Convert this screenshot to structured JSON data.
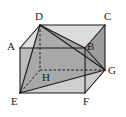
{
  "figure": {
    "kind": "geometry-diagram",
    "shape_name": "rectangular prism",
    "width": 126,
    "height": 117,
    "background_color": "#ffffff",
    "edge_color": "#1a1a1a",
    "hidden_edge_color": "#1a1a1a",
    "label_color": "#1a1a1a",
    "fill_front_color": "#b5b5b5",
    "fill_top_color": "#d2d2d2",
    "fill_right_color": "#9e9e9e",
    "fill_tetra_color": "#a8a8a8",
    "fill_bottom_color": "#c8c8c8"
  },
  "vertices": [
    {
      "id": "A",
      "label": "A",
      "x": 20,
      "y": 48,
      "label_x": 7,
      "label_y": 41,
      "hidden": false
    },
    {
      "id": "B",
      "label": "B",
      "x": 85,
      "y": 48,
      "label_x": 87,
      "label_y": 41,
      "hidden": false
    },
    {
      "id": "C",
      "label": "C",
      "x": 105,
      "y": 25,
      "label_x": 105,
      "label_y": 11,
      "hidden": false
    },
    {
      "id": "D",
      "label": "D",
      "x": 40,
      "y": 25,
      "label_x": 36,
      "label_y": 11,
      "hidden": false
    },
    {
      "id": "E",
      "label": "E",
      "x": 20,
      "y": 93,
      "label_x": 11,
      "label_y": 95,
      "hidden": false
    },
    {
      "id": "F",
      "label": "F",
      "x": 85,
      "y": 93,
      "label_x": 83,
      "label_y": 95,
      "hidden": false
    },
    {
      "id": "G",
      "label": "G",
      "x": 105,
      "y": 70,
      "label_x": 108,
      "label_y": 65,
      "hidden": false
    },
    {
      "id": "H",
      "label": "H",
      "x": 40,
      "y": 70,
      "label_x": 42,
      "label_y": 72,
      "hidden": true
    }
  ],
  "edges": [
    {
      "from": "A",
      "to": "D",
      "hidden": false
    },
    {
      "from": "D",
      "to": "C",
      "hidden": false
    },
    {
      "from": "C",
      "to": "B",
      "hidden": false
    },
    {
      "from": "B",
      "to": "A",
      "hidden": false
    },
    {
      "from": "E",
      "to": "F",
      "hidden": false
    },
    {
      "from": "F",
      "to": "G",
      "hidden": false
    },
    {
      "from": "G",
      "to": "C",
      "hidden": false
    },
    {
      "from": "A",
      "to": "E",
      "hidden": false
    },
    {
      "from": "B",
      "to": "F",
      "hidden": false
    },
    {
      "from": "D",
      "to": "H",
      "hidden": true
    },
    {
      "from": "H",
      "to": "E",
      "hidden": true
    },
    {
      "from": "H",
      "to": "G",
      "hidden": true
    }
  ],
  "diagonals": [
    {
      "from": "D",
      "to": "E",
      "hidden": false
    },
    {
      "from": "D",
      "to": "G",
      "hidden": false
    },
    {
      "from": "E",
      "to": "G",
      "hidden": false
    },
    {
      "from": "D",
      "to": "B",
      "hidden": false
    },
    {
      "from": "B",
      "to": "G",
      "hidden": false
    }
  ],
  "faces": [
    {
      "name": "top-face-ADCB",
      "path": "A D C B",
      "fill": "#d8d8d8"
    },
    {
      "name": "right-face-BCGF",
      "path": "B C G F",
      "fill": "#9e9e9e"
    },
    {
      "name": "front-face-ABFE",
      "path": "A B F E",
      "fill": "#b8b8b8"
    },
    {
      "name": "tetra-face-DEG",
      "path": "D E G",
      "fill": "#a5a5a5"
    },
    {
      "name": "tetra-face-DEH",
      "path": "D E H",
      "fill": "#b0b0b0"
    }
  ]
}
